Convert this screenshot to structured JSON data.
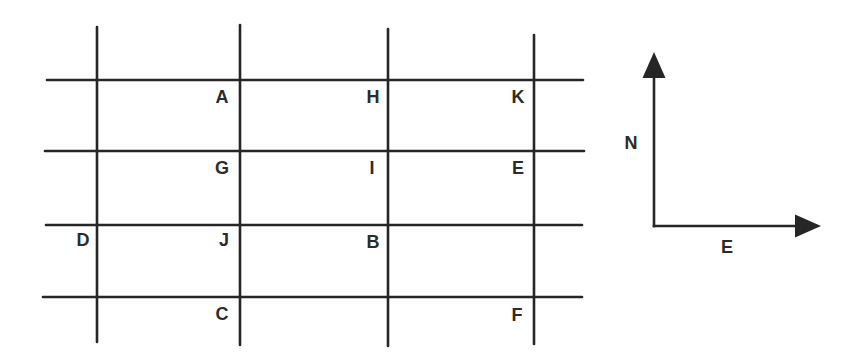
{
  "diagram": {
    "type": "street-grid-with-compass",
    "colors": {
      "ink": "#262626",
      "background": "#ffffff"
    },
    "grid": {
      "vertical_lines": [
        {
          "x": 97,
          "y1": 27,
          "y2": 342
        },
        {
          "x": 240,
          "y1": 25,
          "y2": 345
        },
        {
          "x": 388,
          "y1": 29,
          "y2": 346
        },
        {
          "x": 534,
          "y1": 35,
          "y2": 344
        }
      ],
      "horizontal_lines": [
        {
          "y": 80,
          "x1": 47,
          "x2": 583
        },
        {
          "y": 151,
          "x1": 45,
          "x2": 584
        },
        {
          "y": 225,
          "x1": 46,
          "x2": 582
        },
        {
          "y": 297,
          "x1": 43,
          "x2": 582
        }
      ]
    },
    "points": [
      {
        "label": "A",
        "x": 222,
        "y": 97
      },
      {
        "label": "H",
        "x": 373,
        "y": 97
      },
      {
        "label": "K",
        "x": 518,
        "y": 97
      },
      {
        "label": "G",
        "x": 222,
        "y": 168
      },
      {
        "label": "I",
        "x": 372,
        "y": 168
      },
      {
        "label": "E",
        "x": 518,
        "y": 168
      },
      {
        "label": "D",
        "x": 83,
        "y": 240
      },
      {
        "label": "J",
        "x": 224,
        "y": 240
      },
      {
        "label": "B",
        "x": 373,
        "y": 242
      },
      {
        "label": "C",
        "x": 222,
        "y": 314
      },
      {
        "label": "F",
        "x": 517,
        "y": 315
      }
    ],
    "compass": {
      "origin": {
        "x": 654,
        "y": 226
      },
      "north": {
        "label": "N",
        "tip": {
          "x": 654,
          "y": 52
        },
        "label_pos": {
          "x": 631,
          "y": 143
        }
      },
      "east": {
        "label": "E",
        "tip": {
          "x": 821,
          "y": 226
        },
        "label_pos": {
          "x": 727,
          "y": 247
        }
      }
    }
  }
}
